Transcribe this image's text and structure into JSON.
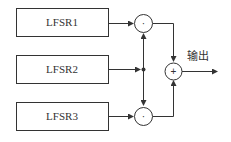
{
  "diagram": {
    "blocks": [
      {
        "id": "lfsr1",
        "label": "LFSR1"
      },
      {
        "id": "lfsr2",
        "label": "LFSR2"
      },
      {
        "id": "lfsr3",
        "label": "LFSR3"
      }
    ],
    "operators": {
      "and_top": "·",
      "and_bottom": "·",
      "xor": "+"
    },
    "output_label": "输出",
    "colors": {
      "stroke": "#333333",
      "background": "#ffffff"
    }
  }
}
